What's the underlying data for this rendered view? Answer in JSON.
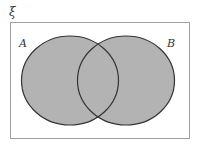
{
  "diagram": {
    "type": "venn",
    "universal_set_label": "ξ",
    "sets": [
      {
        "name": "A",
        "label": "A",
        "shaded": true
      },
      {
        "name": "B",
        "label": "B",
        "shaded": true
      }
    ],
    "shaded_region": "A ∪ B",
    "colors": {
      "shade": "#b3b3b3",
      "outline": "#333333",
      "frame": "#999999",
      "background": "#ffffff"
    }
  }
}
